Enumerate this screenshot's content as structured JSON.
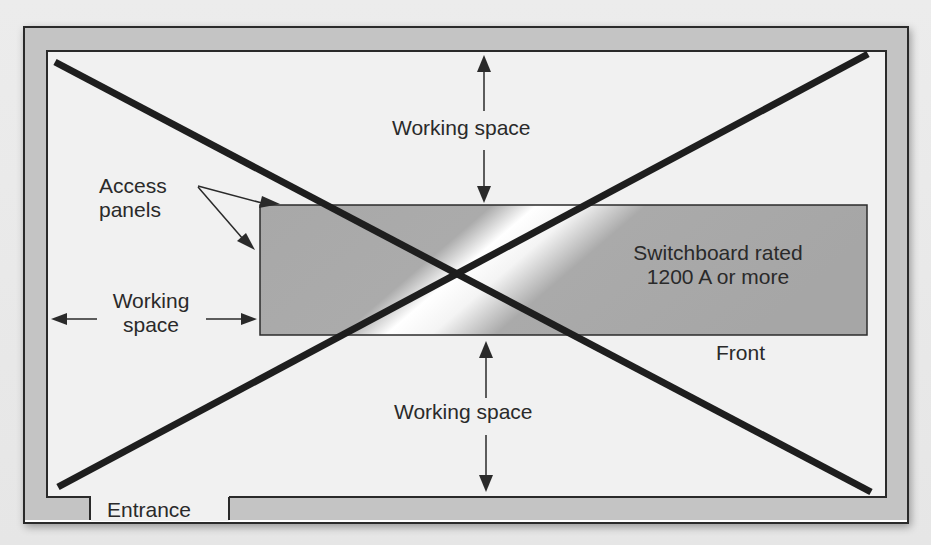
{
  "diagram": {
    "status": "crossed-out (prohibited arrangement)",
    "colors": {
      "wall_fill": "#c4c4c4",
      "wall_stroke": "#2b2b2b",
      "room_floor": "#f1f1f1",
      "switchboard_fill": "#a9a9a9",
      "switchboard_highlight": "#ffffff",
      "cross_lines": "#1e1e1e",
      "text": "#2a2a2a"
    },
    "labels": {
      "working_space_top": "Working space",
      "working_space_bottom": "Working space",
      "working_space_left_line1": "Working",
      "working_space_left_line2": "space",
      "access_panels_line1": "Access",
      "access_panels_line2": "panels",
      "switchboard_line1": "Switchboard rated",
      "switchboard_line2": "1200 A or more",
      "front": "Front",
      "entrance": "Entrance"
    },
    "icons": {
      "up_arrow": "arrow-up",
      "down_arrow": "arrow-down",
      "left_arrow": "arrow-left",
      "right_arrow": "arrow-right",
      "cross": "x-mark"
    }
  }
}
